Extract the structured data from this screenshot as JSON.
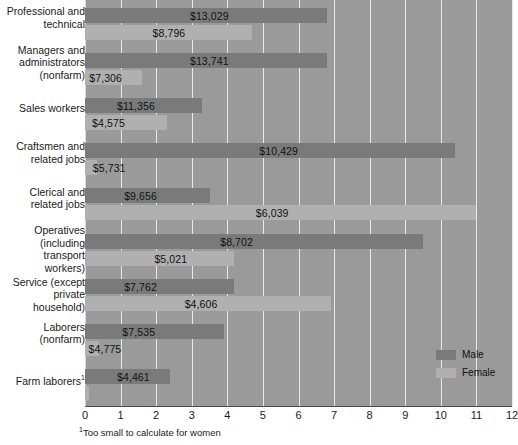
{
  "chart_data": {
    "type": "bar",
    "orientation": "horizontal",
    "title": "",
    "xlabel": "",
    "ylabel": "",
    "xlim": [
      0,
      12
    ],
    "xticks": [
      "0",
      "1",
      "2",
      "3",
      "4",
      "5",
      "6",
      "7",
      "8",
      "9",
      "10",
      "11",
      "12"
    ],
    "grid": true,
    "legend_position": "bottom-right",
    "legend": [
      {
        "name": "Male",
        "color": "#7a7a7a"
      },
      {
        "name": "Female",
        "color": "#b0b0b0"
      }
    ],
    "categories": [
      "Professional and technical",
      "Managers and administrators (nonfarm)",
      "Sales workers",
      "Craftsmen and related jobs",
      "Clerical and related jobs",
      "Operatives (including transport workers)",
      "Service (except private household)",
      "Laborers (nonfarm)",
      "Farm laborers"
    ],
    "series": [
      {
        "name": "Male",
        "values": [
          6.8,
          6.8,
          3.3,
          10.4,
          3.5,
          9.5,
          4.2,
          3.9,
          2.4
        ],
        "labels": [
          "$13,029",
          "$13,741",
          "$11,356",
          "$10,429",
          "$9,656",
          "$8,702",
          "$7,762",
          "$7,535",
          "$4,461"
        ]
      },
      {
        "name": "Female",
        "values": [
          4.7,
          1.6,
          2.3,
          0.35,
          11.0,
          4.2,
          6.9,
          0.4,
          0.1
        ],
        "labels": [
          "$8,796",
          "$7,306",
          "$4,575",
          "$5,731",
          "$6,039",
          "$5,021",
          "$4,606",
          "$4,775",
          ""
        ]
      }
    ]
  },
  "rows": [
    {
      "label_lines": [
        "Professional and",
        "technical"
      ],
      "male": {
        "label": "$13,029",
        "end": 6.8,
        "label_pos": 2.95
      },
      "female": {
        "label": "$8,796",
        "end": 4.7,
        "label_pos": 1.9
      }
    },
    {
      "label_lines": [
        "Managers and",
        "administrators",
        "(nonfarm)"
      ],
      "male": {
        "label": "$13,741",
        "end": 6.8,
        "label_pos": 2.95
      },
      "female": {
        "label": "$7,306",
        "end": 1.6,
        "label_pos": 0.12
      }
    },
    {
      "label_lines": [
        "Sales workers"
      ],
      "male": {
        "label": "$11,356",
        "end": 3.3,
        "label_pos": 0.9
      },
      "female": {
        "label": "$4,575",
        "end": 2.3,
        "label_pos": 0.2
      }
    },
    {
      "label_lines": [
        "Craftsmen and",
        "related jobs"
      ],
      "male": {
        "label": "$10,429",
        "end": 10.4,
        "label_pos": 4.9
      },
      "female": {
        "label": "$5,731",
        "end": 0.35,
        "label_pos": 0.22
      }
    },
    {
      "label_lines": [
        "Clerical and",
        "related jobs"
      ],
      "male": {
        "label": "$9,656",
        "end": 3.5,
        "label_pos": 1.1
      },
      "female": {
        "label": "$6,039",
        "end": 11.0,
        "label_pos": 4.8
      }
    },
    {
      "label_lines": [
        "Operatives",
        "(including transport",
        "workers)"
      ],
      "male": {
        "label": "$8,702",
        "end": 9.5,
        "label_pos": 3.8
      },
      "female": {
        "label": "$5,021",
        "end": 4.2,
        "label_pos": 1.95
      }
    },
    {
      "label_lines": [
        "Service (except",
        "private household)"
      ],
      "male": {
        "label": "$7,762",
        "end": 4.2,
        "label_pos": 1.1
      },
      "female": {
        "label": "$4,606",
        "end": 6.9,
        "label_pos": 2.8
      }
    },
    {
      "label_lines": [
        "Laborers",
        "(nonfarm)"
      ],
      "male": {
        "label": "$7,535",
        "end": 3.9,
        "label_pos": 1.05
      },
      "female": {
        "label": "$4,775",
        "end": 0.4,
        "label_pos": 0.1
      }
    },
    {
      "label_lines": [
        "Farm laborers",
        "1"
      ],
      "male": {
        "label": "$4,461",
        "end": 2.4,
        "label_pos": 0.9
      },
      "female": {
        "label": "",
        "end": 0.1,
        "label_pos": 0.15
      }
    }
  ],
  "legend": {
    "male_label": "Male",
    "female_label": "Female"
  },
  "footnote": {
    "marker": "1",
    "text": "Too small to calculate for women"
  },
  "axis": {
    "ticks": [
      "0",
      "1",
      "2",
      "3",
      "4",
      "5",
      "6",
      "7",
      "8",
      "9",
      "10",
      "11",
      "12"
    ]
  }
}
